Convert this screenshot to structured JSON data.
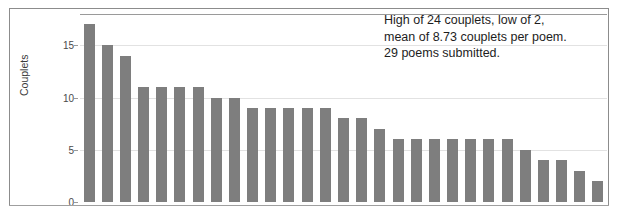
{
  "figure": {
    "annotation_lines": [
      "High of 24 couplets, low of 2,",
      "mean of 8.73 couplets per poem.",
      "29 poems submitted."
    ],
    "colors": {
      "bar": "#7e7e7e",
      "grid": "#e2e2e2",
      "axis": "#9a9a9a",
      "frame": "#8c8c8c",
      "text": "#1d1d1d"
    }
  },
  "chart_data": {
    "type": "bar",
    "title": "",
    "xlabel": "",
    "ylabel": "Couplets",
    "ylim": [
      0,
      18
    ],
    "yticks": [
      0,
      5,
      10,
      15
    ],
    "ytick_labels": [
      "0",
      "5",
      "10",
      "15"
    ],
    "grid": true,
    "legend": "none",
    "categories": [
      "1",
      "2",
      "3",
      "4",
      "5",
      "6",
      "7",
      "8",
      "9",
      "10",
      "11",
      "12",
      "13",
      "14",
      "15",
      "16",
      "17",
      "18",
      "19",
      "20",
      "21",
      "22",
      "23",
      "24",
      "25",
      "26",
      "27",
      "28",
      "29"
    ],
    "values": [
      17,
      15,
      14,
      11,
      11,
      11,
      11,
      10,
      10,
      9,
      9,
      9,
      9,
      9,
      8,
      8,
      7,
      6,
      6,
      6,
      6,
      6,
      6,
      6,
      5,
      4,
      4,
      3,
      2
    ],
    "annotations": [
      "High of 24 couplets, low of 2,",
      "mean of 8.73 couplets per poem.",
      "29 poems submitted."
    ],
    "summary": {
      "high": 24,
      "low": 2,
      "mean": 8.73,
      "count": 29
    }
  }
}
